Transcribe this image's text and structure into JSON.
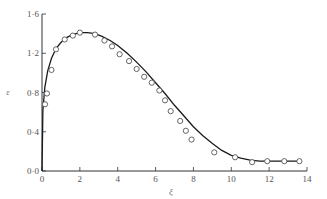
{
  "chart_data": {
    "type": "scatter",
    "title": "",
    "xlabel": "ξ",
    "ylabel": "ε",
    "xlim": [
      0,
      14
    ],
    "ylim": [
      0.0,
      1.6
    ],
    "x_ticks": [
      "0",
      "2",
      "4",
      "6",
      "8",
      "10",
      "12",
      "14"
    ],
    "y_ticks": [
      "0·0",
      "0·4",
      "0·8",
      "1·2",
      "1·6"
    ],
    "grid": false,
    "legend": null,
    "series": [
      {
        "name": "theory",
        "kind": "line",
        "x": [
          0.0,
          0.05,
          0.15,
          0.3,
          0.5,
          0.75,
          1.0,
          1.3,
          1.6,
          2.0,
          2.4,
          2.8,
          3.2,
          3.6,
          4.0,
          4.5,
          5.0,
          5.5,
          6.0,
          6.5,
          7.0,
          7.5,
          8.0,
          8.5,
          9.0,
          9.5,
          10.0,
          10.5,
          11.0,
          11.5,
          12.0,
          12.5,
          13.0,
          13.6
        ],
        "y": [
          0.0,
          0.62,
          0.85,
          1.02,
          1.15,
          1.25,
          1.31,
          1.36,
          1.39,
          1.41,
          1.41,
          1.4,
          1.37,
          1.33,
          1.28,
          1.2,
          1.11,
          1.01,
          0.9,
          0.79,
          0.67,
          0.56,
          0.45,
          0.36,
          0.28,
          0.21,
          0.16,
          0.13,
          0.11,
          0.1,
          0.1,
          0.1,
          0.1,
          0.1
        ]
      },
      {
        "name": "experiment",
        "kind": "scatter",
        "marker": "open-circle",
        "x": [
          0.16,
          0.26,
          0.5,
          0.74,
          1.2,
          1.63,
          2.0,
          2.8,
          3.3,
          3.7,
          4.1,
          4.6,
          5.0,
          5.4,
          5.8,
          6.2,
          6.5,
          6.8,
          7.3,
          7.6,
          7.9,
          9.1,
          10.2,
          11.1,
          11.9,
          12.8,
          13.6
        ],
        "y": [
          0.68,
          0.79,
          1.03,
          1.24,
          1.34,
          1.38,
          1.41,
          1.39,
          1.33,
          1.27,
          1.19,
          1.12,
          1.04,
          0.96,
          0.9,
          0.82,
          0.72,
          0.61,
          0.51,
          0.41,
          0.32,
          0.19,
          0.14,
          0.09,
          0.1,
          0.1,
          0.1
        ]
      }
    ]
  },
  "style": {
    "line_color": "#1a1a1a",
    "marker_color": "#555555",
    "axis_color": "#333333"
  }
}
